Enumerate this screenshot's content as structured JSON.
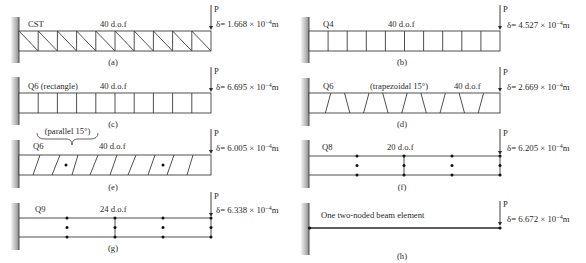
{
  "figure": {
    "panels": {
      "a": {
        "element": "CST",
        "dof": "40 d.o.f",
        "load": "P",
        "delta_main": "δ= 1.668 × 10",
        "exponent": "−4",
        "unit": "m",
        "caption": "(a)"
      },
      "b": {
        "element": "Q4",
        "dof": "40 d.o.f",
        "load": "P",
        "delta_main": "δ= 4.527 × 10",
        "exponent": "−4",
        "unit": "m",
        "caption": "(b)"
      },
      "c": {
        "element": "Q6 (rectangle)",
        "dof": "40 d.o.f",
        "load": "P",
        "delta_main": "δ= 6.695 × 10",
        "exponent": "−4",
        "unit": "m",
        "caption": "(c)"
      },
      "d": {
        "element": "Q6",
        "note": "(trapezoidal 15°)",
        "dof": "40 d.o.f",
        "load": "P",
        "delta_main": "δ= 2.669 × 10",
        "exponent": "−4",
        "unit": "m",
        "caption": "(d)"
      },
      "e": {
        "element": "Q6",
        "note": "(parallel 15°)",
        "dof": "40 d.o.f",
        "load": "P",
        "delta_main": "δ= 6.005 × 10",
        "exponent": "−4",
        "unit": "m",
        "caption": "(e)"
      },
      "f": {
        "element": "Q8",
        "dof": "20 d.o.f",
        "load": "P",
        "delta_main": "δ= 6.205 × 10",
        "exponent": "−4",
        "unit": "m",
        "caption": "(f)"
      },
      "g": {
        "element": "Q9",
        "dof": "24 d.o.f",
        "load": "P",
        "delta_main": "δ= 6.338 × 10",
        "exponent": "−4",
        "unit": "m",
        "caption": "(g)"
      },
      "h": {
        "element": "One two-noded beam element",
        "load": "P",
        "delta_main": "δ= 6.672 × 10",
        "exponent": "−4",
        "unit": "m",
        "caption": "(h)"
      }
    }
  },
  "colors": {
    "line": "#3c3c3c",
    "text": "#2a2a2a",
    "wall_light": "#f2f2f2",
    "wall_dark": "#8c8c8c",
    "background": "#ffffff"
  }
}
